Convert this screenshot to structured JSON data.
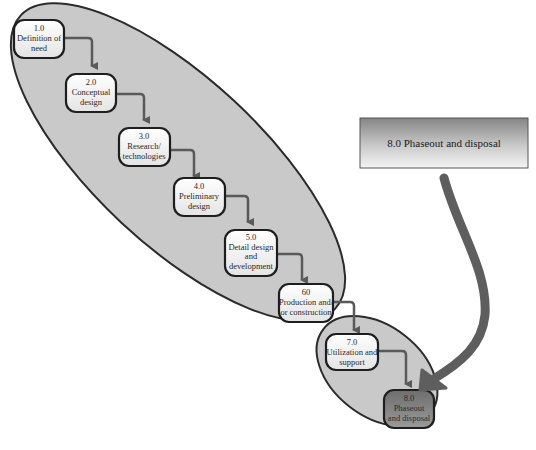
{
  "diagram": {
    "type": "system-life-cycle-flow",
    "colors": {
      "ellipse_fill": "#c8c8c8",
      "ellipse_stroke": "#2b2b2b",
      "node_fill_light": "#f2f2f2",
      "node_stroke": "#1e1e1e",
      "arrow": "#5a5a5a",
      "node8_fill": "#7d7d7d",
      "callout_top": "#8a8a8a",
      "callout_bottom": "#f4f4f4",
      "big_arrow": "#5e5e5e"
    },
    "nodes": [
      {
        "id": "1.0",
        "lines": [
          "1.0",
          "Definition of",
          "need"
        ]
      },
      {
        "id": "2.0",
        "lines": [
          "2.0",
          "Conceptual",
          "design"
        ]
      },
      {
        "id": "3.0",
        "lines": [
          "3.0",
          "Research/",
          "technologies"
        ]
      },
      {
        "id": "4.0",
        "lines": [
          "4.0",
          "Preliminary",
          "design"
        ]
      },
      {
        "id": "5.0",
        "lines": [
          "5.0",
          "Detail design",
          "and",
          "development"
        ]
      },
      {
        "id": "6.0",
        "lines": [
          "60",
          "Production and/",
          "or construction"
        ]
      },
      {
        "id": "7.0",
        "lines": [
          "7.0",
          "Utilization and",
          "support"
        ]
      },
      {
        "id": "8.0",
        "lines": [
          "8.0",
          "Phaseout",
          "and disposal"
        ]
      }
    ],
    "callout": {
      "label": "8.0 Phaseout and disposal"
    }
  }
}
